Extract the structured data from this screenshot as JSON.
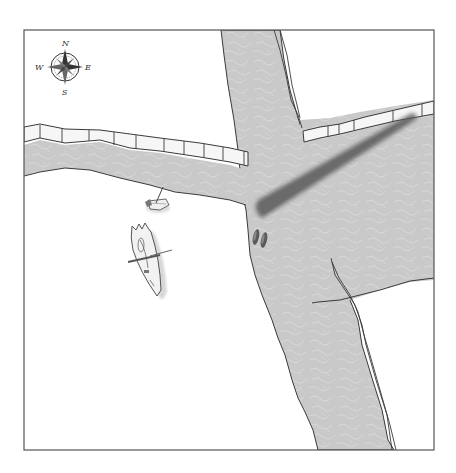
{
  "map": {
    "type": "battle-map",
    "frame": {
      "x": 24,
      "y": 30,
      "width": 410,
      "height": 420
    },
    "colors": {
      "background": "#ffffff",
      "water": "#c9c9c9",
      "water_highlight": "#dedede",
      "outline": "#3a3a3a",
      "cliff_face": "#f4f4f4",
      "shadow_beam": "#6e6e6e"
    },
    "compass": {
      "north": "N",
      "south": "S",
      "east": "E",
      "west": "W"
    },
    "features": [
      {
        "name": "main-river",
        "description": "River flowing north to south"
      },
      {
        "name": "tributary",
        "description": "Tributary flowing from west to east across the map"
      },
      {
        "name": "bridge-shadow",
        "description": "Dark diagonal log or bridge shadow spanning the east channel"
      },
      {
        "name": "small-boat",
        "description": "Small wrecked rowboat on the west bank"
      },
      {
        "name": "shipwreck",
        "description": "Wrecked longboat on the west bank"
      },
      {
        "name": "canoes",
        "description": "Two small canoes in the river"
      }
    ]
  }
}
